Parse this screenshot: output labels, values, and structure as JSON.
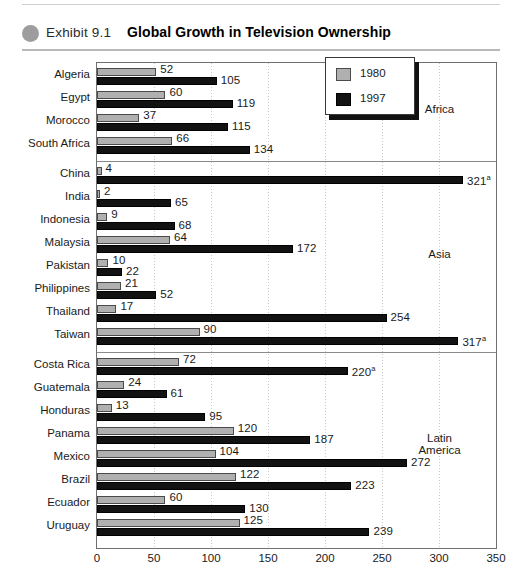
{
  "header": {
    "bullet_icon": "circle-bullet-icon",
    "exhibit_label": "Exhibit 9.1",
    "title": "Global Growth in Television Ownership"
  },
  "legend": {
    "items": [
      {
        "label": "1980",
        "color": "#b0b0b0"
      },
      {
        "label": "1997",
        "color": "#121212"
      }
    ]
  },
  "chart_data": {
    "type": "bar",
    "orientation": "horizontal",
    "title": "Global Growth in Television Ownership",
    "xlabel": "",
    "ylabel": "",
    "xlim": [
      0,
      350
    ],
    "xticks": [
      "0",
      "50",
      "100",
      "150",
      "200",
      "250",
      "300",
      "350"
    ],
    "grid": true,
    "legend_position": "top-right",
    "series": [
      {
        "name": "1980",
        "color": "#b0b0b0"
      },
      {
        "name": "1997",
        "color": "#121212"
      }
    ],
    "groups": [
      {
        "region": "Africa",
        "region_label_lines": [
          "Africa"
        ],
        "rows": [
          {
            "category": "Algeria",
            "v1980": 52,
            "v1997": 105,
            "label1980": "52",
            "label1997": "105"
          },
          {
            "category": "Egypt",
            "v1980": 60,
            "v1997": 119,
            "label1980": "60",
            "label1997": "119"
          },
          {
            "category": "Morocco",
            "v1980": 37,
            "v1997": 115,
            "label1980": "37",
            "label1997": "115"
          },
          {
            "category": "South Africa",
            "v1980": 66,
            "v1997": 134,
            "label1980": "66",
            "label1997": "134"
          }
        ]
      },
      {
        "region": "Asia",
        "region_label_lines": [
          "Asia"
        ],
        "rows": [
          {
            "category": "China",
            "v1980": 4,
            "v1997": 321,
            "label1980": "4",
            "label1997": "321",
            "note1997": "a"
          },
          {
            "category": "India",
            "v1980": 2,
            "v1997": 65,
            "label1980": "2",
            "label1997": "65"
          },
          {
            "category": "Indonesia",
            "v1980": 9,
            "v1997": 68,
            "label1980": "9",
            "label1997": "68"
          },
          {
            "category": "Malaysia",
            "v1980": 64,
            "v1997": 172,
            "label1980": "64",
            "label1997": "172"
          },
          {
            "category": "Pakistan",
            "v1980": 10,
            "v1997": 22,
            "label1980": "10",
            "label1997": "22"
          },
          {
            "category": "Philippines",
            "v1980": 21,
            "v1997": 52,
            "label1980": "21",
            "label1997": "52"
          },
          {
            "category": "Thailand",
            "v1980": 17,
            "v1997": 254,
            "label1980": "17",
            "label1997": "254"
          },
          {
            "category": "Taiwan",
            "v1980": 90,
            "v1997": 317,
            "label1980": "90",
            "label1997": "317",
            "note1997": "a"
          }
        ]
      },
      {
        "region": "Latin America",
        "region_label_lines": [
          "Latin",
          "America"
        ],
        "rows": [
          {
            "category": "Costa Rica",
            "v1980": 72,
            "v1997": 220,
            "label1980": "72",
            "label1997": "220",
            "note1997": "a"
          },
          {
            "category": "Guatemala",
            "v1980": 24,
            "v1997": 61,
            "label1980": "24",
            "label1997": "61"
          },
          {
            "category": "Honduras",
            "v1980": 13,
            "v1997": 95,
            "label1980": "13",
            "label1997": "95"
          },
          {
            "category": "Panama",
            "v1980": 120,
            "v1997": 187,
            "label1980": "120",
            "label1997": "187"
          },
          {
            "category": "Mexico",
            "v1980": 104,
            "v1997": 272,
            "label1980": "104",
            "label1997": "272"
          },
          {
            "category": "Brazil",
            "v1980": 122,
            "v1997": 223,
            "label1980": "122",
            "label1997": "223"
          },
          {
            "category": "Ecuador",
            "v1980": 60,
            "v1997": 130,
            "label1980": "60",
            "label1997": "130"
          },
          {
            "category": "Uruguay",
            "v1980": 125,
            "v1997": 239,
            "label1980": "125",
            "label1997": "239"
          }
        ]
      }
    ]
  }
}
